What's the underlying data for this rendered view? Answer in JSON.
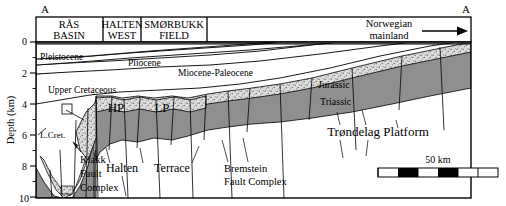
{
  "figure": {
    "type": "geological-cross-section",
    "section_label_left": "A",
    "section_label_right": "A"
  },
  "axis": {
    "title": "Depth (km)",
    "ticks": [
      "0",
      "2",
      "4",
      "6",
      "8",
      "10"
    ],
    "minor_ticks": [
      "1",
      "3",
      "5",
      "7",
      "9"
    ],
    "range_km": [
      0,
      10
    ]
  },
  "header_boxes": [
    {
      "line1": "RÅS",
      "line2": "BASIN"
    },
    {
      "line1": "HALTEN",
      "line2": "WEST"
    },
    {
      "line1": "SMØRBUKK",
      "line2": "FIELD"
    }
  ],
  "header_right": {
    "line1": "Norwegian",
    "line2": "mainland",
    "arrow": "arrow-right-icon"
  },
  "strata_labels": [
    {
      "id": "pleistocene",
      "text": "Pleistocene"
    },
    {
      "id": "pliocene",
      "text": "Pliocene"
    },
    {
      "id": "miocene-paleocene",
      "text": "Miocene-Paleocene"
    },
    {
      "id": "upper-cretaceous",
      "text": "Upper Cretaceous"
    },
    {
      "id": "lower-cretaceous",
      "text": "L.Cret."
    },
    {
      "id": "jurassic",
      "text": "Jurassic"
    },
    {
      "id": "triassic",
      "text": "Triassic"
    }
  ],
  "block_labels": [
    {
      "id": "hp",
      "text": "HP"
    },
    {
      "id": "lp",
      "text": "LP"
    }
  ],
  "structure_labels": [
    {
      "id": "klakk-fault-complex",
      "lines": [
        "Klakk",
        "Fault",
        "Complex"
      ]
    },
    {
      "id": "halten-terrace",
      "lines": [
        "Halten",
        "Terrace"
      ]
    },
    {
      "id": "bremstein-fault-complex",
      "lines": [
        "Bremstein",
        "Fault Complex"
      ]
    },
    {
      "id": "trondelag-platform",
      "lines": [
        "Trøndelag Platform"
      ]
    }
  ],
  "halten_terrace": {
    "word1": "Halten",
    "word2": "Terrace"
  },
  "bremstein": {
    "line1": "Bremstein",
    "line2": "Fault Complex"
  },
  "klakk": {
    "line1": "Klakk",
    "line2": "Fault",
    "line3": "Complex"
  },
  "trondelag": {
    "text": "Trøndelag Platform"
  },
  "scalebar": {
    "label": "50 km",
    "segments": 6
  },
  "colors": {
    "frame": "#000000",
    "background": "#ffffff",
    "jurassic_fill": "#d9d9d9",
    "triassic_fill": "#8c8c8c",
    "cretaceous_fill": "#ffffff",
    "deep_fill": "#a8a8a8"
  }
}
